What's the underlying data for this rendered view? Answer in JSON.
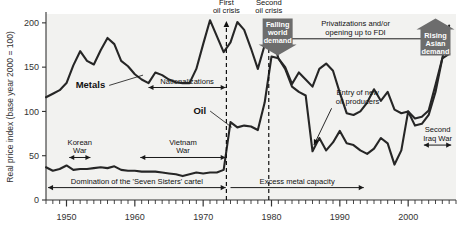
{
  "chart_data": {
    "type": "line",
    "title": "",
    "xlabel": "",
    "ylabel": "Real price index (base year 2000 = 100)",
    "xlim": [
      1947,
      2007
    ],
    "ylim": [
      0,
      210
    ],
    "yticks": [
      0,
      50,
      100,
      150,
      200
    ],
    "xticks": [
      1950,
      1960,
      1970,
      1980,
      1990,
      2000
    ],
    "xtick_labels": [
      "1950",
      "1960",
      "1970",
      "1980",
      "1990",
      "2000"
    ],
    "ytick_labels": [
      "0",
      "50",
      "100",
      "150",
      "200"
    ],
    "grid": false,
    "legend": "inline-labels",
    "series": [
      {
        "name": "Metals",
        "x": [
          1947,
          1948,
          1949,
          1950,
          1951,
          1952,
          1953,
          1954,
          1955,
          1956,
          1957,
          1958,
          1959,
          1960,
          1961,
          1962,
          1963,
          1964,
          1965,
          1966,
          1967,
          1968,
          1969,
          1970,
          1971,
          1972,
          1973,
          1974,
          1975,
          1976,
          1977,
          1978,
          1979,
          1980,
          1981,
          1982,
          1983,
          1984,
          1985,
          1986,
          1987,
          1988,
          1989,
          1990,
          1991,
          1992,
          1993,
          1994,
          1995,
          1996,
          1997,
          1998,
          1999,
          2000,
          2001,
          2002,
          2003,
          2004,
          2005,
          2006
        ],
        "values": [
          116,
          120,
          124,
          132,
          152,
          168,
          157,
          153,
          169,
          183,
          176,
          157,
          151,
          142,
          136,
          132,
          144,
          141,
          136,
          133,
          132,
          132,
          148,
          176,
          203,
          185,
          167,
          178,
          201,
          192,
          171,
          148,
          175,
          190,
          160,
          150,
          131,
          144,
          136,
          128,
          148,
          154,
          146,
          121,
          98,
          96,
          100,
          110,
          125,
          112,
          122,
          102,
          98,
          100,
          92,
          94,
          101,
          130,
          160,
          197
        ],
        "style": {
          "color": "#262626",
          "width": 2.1
        }
      },
      {
        "name": "Oil",
        "x": [
          1947,
          1948,
          1949,
          1950,
          1951,
          1952,
          1953,
          1954,
          1955,
          1956,
          1957,
          1958,
          1959,
          1960,
          1961,
          1962,
          1963,
          1964,
          1965,
          1966,
          1967,
          1968,
          1969,
          1970,
          1971,
          1972,
          1973,
          1974,
          1975,
          1976,
          1977,
          1978,
          1979,
          1980,
          1981,
          1982,
          1983,
          1984,
          1985,
          1986,
          1987,
          1988,
          1989,
          1990,
          1991,
          1992,
          1993,
          1994,
          1995,
          1996,
          1997,
          1998,
          1999,
          2000,
          2001,
          2002,
          2003,
          2004,
          2005,
          2006
        ],
        "values": [
          37,
          33,
          35,
          39,
          34,
          35,
          35,
          36,
          37,
          36,
          38,
          34,
          33,
          33,
          32,
          32,
          32,
          31,
          30,
          29,
          27,
          29,
          31,
          30,
          31,
          31,
          34,
          88,
          82,
          84,
          83,
          79,
          110,
          162,
          160,
          148,
          128,
          122,
          118,
          55,
          70,
          56,
          65,
          78,
          64,
          62,
          56,
          52,
          58,
          70,
          64,
          40,
          56,
          100,
          84,
          86,
          96,
          122,
          160,
          165
        ],
        "style": {
          "color": "#262626",
          "width": 2.1
        }
      }
    ],
    "series_inline_labels": [
      {
        "text": "Metals",
        "x": 1953.5,
        "y": 126,
        "leader_to_x": 1961.2,
        "leader_to_y": 141
      },
      {
        "text": "Oil",
        "x": 1969.5,
        "y": 97,
        "leader_to_x": 1974.2,
        "leader_to_y": 82
      }
    ],
    "event_markers": [
      {
        "label_line1": "First",
        "label_line2": "oil crisis",
        "x": 1973.4,
        "style": "dashed-vertical-with-arrow"
      },
      {
        "label_line1": "Second",
        "label_line2": "oil crisis",
        "x": 1979.6,
        "style": "dashed-vertical-with-arrow"
      }
    ],
    "span_annotations": [
      {
        "text": "Korean\nWar",
        "x_start": 1950.4,
        "x_end": 1953.5,
        "y": 48,
        "arrows": "both"
      },
      {
        "text": "Vietnam\nWar",
        "x_start": 1960.8,
        "x_end": 1973.3,
        "y": 48,
        "arrows": "both"
      },
      {
        "text": "Nationalizations",
        "x_start": 1962.0,
        "x_end": 1973.3,
        "y": 127,
        "arrows": "both"
      },
      {
        "text": "Domination of the 'Seven Sisters' cartel",
        "x_start": 1947.3,
        "x_end": 1973.3,
        "y": 14,
        "arrows": "both"
      },
      {
        "text": "Excess metal capacity",
        "x_start": 1974.0,
        "x_end": 1993.5,
        "y": 14,
        "arrows": "right"
      },
      {
        "text": "Privatizations and/or\nopening up to FDI",
        "x_start": 1981.6,
        "x_end": 2003.0,
        "y": 182,
        "arrows": "both"
      },
      {
        "text": "Second\nIraq War",
        "x_start": 2002.3,
        "x_end": 2006.3,
        "y": 62,
        "arrows": "both"
      }
    ],
    "callout_annotations": [
      {
        "text": "Entry of new\noil producers",
        "x": 1992.6,
        "y": 118,
        "leader_to_x": 1986.2,
        "leader_to_y": 62
      }
    ],
    "badges": [
      {
        "text": "Falling\nworld\ndemand",
        "direction": "down",
        "x": 1980.9,
        "y_top": 205,
        "color": "#6d6d6d"
      },
      {
        "text": "Rising\nAsian\ndemand",
        "direction": "up",
        "x": 2004.0,
        "y_top": 205,
        "color": "#6d6d6d"
      }
    ],
    "colors": {
      "plot_background": "#f2f2f0",
      "line": "#262626",
      "axis": "#333333",
      "text": "#111111",
      "badge": "#6d6d6d",
      "badge_text": "#ffffff"
    }
  }
}
